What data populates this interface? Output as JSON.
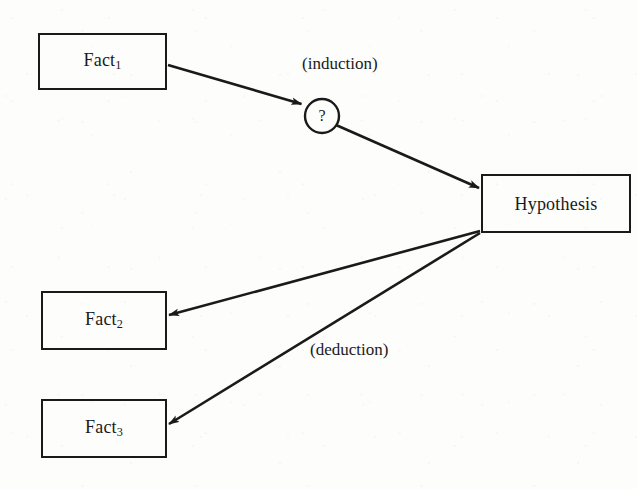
{
  "diagram": {
    "canvas": {
      "width": 637,
      "height": 489
    },
    "colors": {
      "background": "#fdfdfc",
      "stroke": "#1a1a1a",
      "text": "#1a1a1a"
    },
    "nodes": [
      {
        "id": "fact1",
        "kind": "box",
        "text": "Fact",
        "subscript": "1",
        "x": 38,
        "y": 33,
        "width": 129,
        "height": 57
      },
      {
        "id": "question",
        "kind": "circle",
        "text": "?",
        "cx": 322,
        "cy": 116,
        "r": 17
      },
      {
        "id": "hypothesis",
        "kind": "box",
        "text": "Hypothesis",
        "subscript": "",
        "x": 481,
        "y": 174,
        "width": 150,
        "height": 59
      },
      {
        "id": "fact2",
        "kind": "box",
        "text": "Fact",
        "subscript": "2",
        "x": 41,
        "y": 291,
        "width": 126,
        "height": 59
      },
      {
        "id": "fact3",
        "kind": "box",
        "text": "Fact",
        "subscript": "3",
        "x": 41,
        "y": 399,
        "width": 126,
        "height": 59
      }
    ],
    "edges": [
      {
        "id": "edge-fact1-question",
        "from": "fact1",
        "to": "question",
        "arrow": true
      },
      {
        "id": "edge-question-hypothesis",
        "from": "question",
        "to": "hypothesis",
        "arrow": true
      },
      {
        "id": "edge-hypothesis-fact2",
        "from": "hypothesis",
        "to": "fact2",
        "arrow": true
      },
      {
        "id": "edge-hypothesis-fact3",
        "from": "hypothesis",
        "to": "fact3",
        "arrow": true
      }
    ],
    "edge_labels": [
      {
        "id": "induction-label",
        "text": "(induction)",
        "x": 302,
        "y": 55
      },
      {
        "id": "deduction-label",
        "text": "(deduction)",
        "x": 310,
        "y": 341
      }
    ]
  }
}
